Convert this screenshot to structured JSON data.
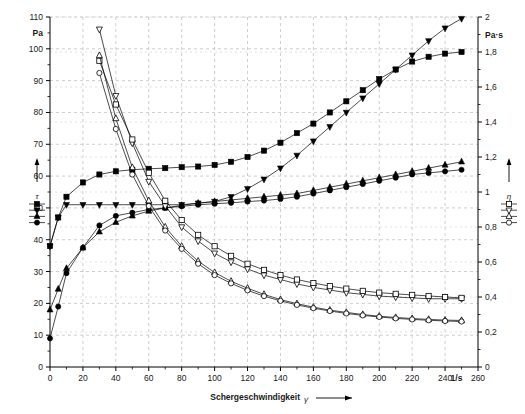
{
  "chart_data": {
    "type": "line",
    "title": "",
    "xlabel": "Schergeschwindigkeit",
    "xlabel_symbol": "γ̇",
    "xunit": "1/s",
    "ylabel_left_unit": "Pa",
    "ylabel_left_symbol": "τ",
    "ylabel_right_unit": "Pa·s",
    "ylabel_right_symbol": "η",
    "xlim": [
      0,
      260
    ],
    "ylim_left": [
      0,
      110
    ],
    "ylim_right": [
      0,
      2
    ],
    "xticks": [
      0,
      20,
      40,
      60,
      80,
      100,
      120,
      140,
      160,
      180,
      200,
      220,
      240,
      260
    ],
    "yticks_left": [
      0,
      10,
      20,
      30,
      40,
      50,
      60,
      70,
      80,
      90,
      100,
      110
    ],
    "yticks_right": [
      "0",
      "0,2",
      "0,4",
      "0,6",
      "0,8",
      "1",
      "1,2",
      "1,4",
      "1,6",
      "1,8",
      "2"
    ],
    "grid": true,
    "grid_style": "dashed",
    "legend_left_label": "τ",
    "legend_right_label": "η",
    "legend_left_markers": [
      "filled-square",
      "filled-down-triangle",
      "filled-up-triangle",
      "filled-circle"
    ],
    "legend_right_markers": [
      "open-square",
      "open-down-triangle",
      "open-up-triangle",
      "open-circle"
    ],
    "x": [
      0,
      5,
      10,
      20,
      30,
      40,
      50,
      60,
      70,
      80,
      90,
      100,
      110,
      120,
      130,
      140,
      150,
      160,
      170,
      180,
      190,
      200,
      210,
      220,
      230,
      240,
      250
    ],
    "series": [
      {
        "name": "tau-square",
        "axis": "left",
        "marker": "filled-square",
        "values": [
          38,
          47,
          53.5,
          58,
          60.5,
          61.5,
          62,
          62.3,
          62.5,
          62.8,
          63,
          63.5,
          64.5,
          66,
          68,
          70.5,
          73.5,
          76.5,
          80,
          83.5,
          87,
          90.5,
          93.5,
          96,
          97.5,
          98.5,
          99
        ]
      },
      {
        "name": "tau-down-triangle",
        "axis": "left",
        "marker": "filled-down-triangle",
        "values": [
          38,
          47,
          51,
          51,
          51,
          51,
          51,
          51,
          51,
          51,
          51.5,
          52,
          53.5,
          56,
          59,
          62.5,
          66.5,
          71,
          75.5,
          80,
          84.5,
          89,
          93.5,
          98,
          102.5,
          106.5,
          109.5
        ]
      },
      {
        "name": "tau-up-triangle",
        "axis": "left",
        "marker": "filled-up-triangle",
        "values": [
          18,
          24.5,
          31,
          37.5,
          42.5,
          45.5,
          47.5,
          49,
          50,
          50.8,
          51.5,
          52,
          52.5,
          53,
          53.5,
          54,
          54.5,
          55.5,
          56.5,
          57.5,
          58.5,
          59.5,
          60.5,
          61.5,
          62.5,
          63.5,
          64.5
        ]
      },
      {
        "name": "tau-circle",
        "axis": "left",
        "marker": "filled-circle",
        "values": [
          9,
          19,
          29.5,
          37.5,
          44.5,
          47.5,
          48.5,
          49.5,
          50,
          50.5,
          51,
          51.3,
          51.6,
          52,
          52.3,
          52.8,
          53.5,
          54.5,
          55.5,
          56.5,
          57.5,
          58.5,
          59.5,
          60.5,
          61,
          61.5,
          62
        ]
      },
      {
        "name": "eta-down-triangle",
        "axis": "right",
        "marker": "open-down-triangle",
        "values": [
          null,
          null,
          null,
          null,
          1.93,
          1.55,
          1.28,
          1.06,
          0.92,
          0.8,
          0.72,
          0.65,
          0.6,
          0.56,
          0.525,
          0.5,
          0.475,
          0.455,
          0.44,
          0.425,
          0.415,
          0.405,
          0.4,
          0.395,
          0.39,
          0.39,
          0.39
        ]
      },
      {
        "name": "eta-square",
        "axis": "right",
        "marker": "open-square",
        "values": [
          null,
          null,
          null,
          null,
          1.75,
          1.5,
          1.3,
          1.11,
          0.95,
          0.84,
          0.755,
          0.69,
          0.635,
          0.59,
          0.555,
          0.525,
          0.5,
          0.48,
          0.462,
          0.448,
          0.435,
          0.425,
          0.418,
          0.412,
          0.406,
          0.4,
          0.395
        ]
      },
      {
        "name": "eta-up-triangle",
        "axis": "right",
        "marker": "open-up-triangle",
        "values": [
          null,
          null,
          null,
          null,
          1.78,
          1.42,
          1.14,
          0.95,
          0.8,
          0.69,
          0.605,
          0.54,
          0.49,
          0.45,
          0.415,
          0.385,
          0.362,
          0.342,
          0.325,
          0.312,
          0.3,
          0.29,
          0.283,
          0.277,
          0.272,
          0.268,
          0.266
        ]
      },
      {
        "name": "eta-circle",
        "axis": "right",
        "marker": "open-circle",
        "values": [
          null,
          null,
          null,
          null,
          1.68,
          1.36,
          1.1,
          0.92,
          0.78,
          0.675,
          0.59,
          0.525,
          0.478,
          0.438,
          0.405,
          0.378,
          0.355,
          0.336,
          0.32,
          0.306,
          0.295,
          0.286,
          0.278,
          0.272,
          0.267,
          0.263,
          0.26
        ]
      }
    ]
  },
  "axes": {
    "left_unit": "Pa",
    "right_unit": "Pa·s",
    "x_unit": "1/s",
    "x_title": "Schergeschwindigkeit"
  }
}
